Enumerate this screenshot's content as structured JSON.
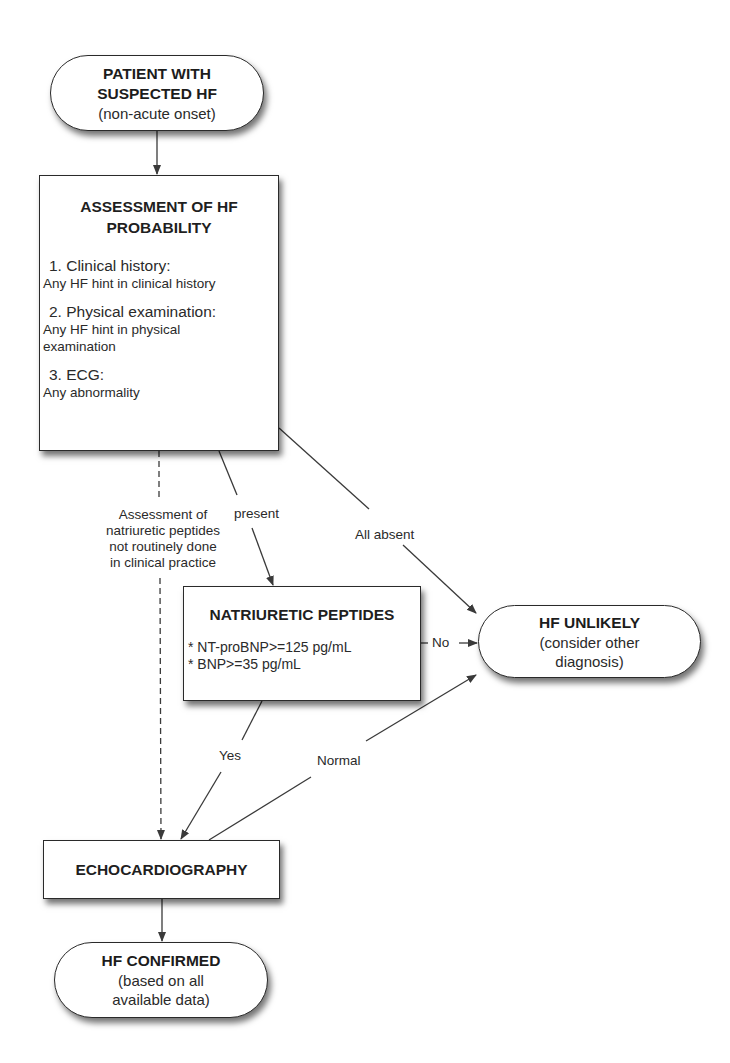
{
  "diagram": {
    "type": "flowchart",
    "nodes": {
      "start": {
        "title_line1": "PATIENT WITH",
        "title_line2": "SUSPECTED HF",
        "subtitle": "(non-acute onset)"
      },
      "assessment": {
        "title_line1": "ASSESSMENT OF HF",
        "title_line2": "PROBABILITY",
        "items": [
          {
            "heading": "1. Clinical history:",
            "body": "Any HF hint in clinical history"
          },
          {
            "heading": "2. Physical examination:",
            "body": "Any HF hint in physical examination"
          },
          {
            "heading": "3. ECG:",
            "body": "Any abnormality"
          }
        ]
      },
      "natriuretic_peptides": {
        "title": "NATRIURETIC PEPTIDES",
        "criteria": [
          "* NT-proBNP>=125 pg/mL",
          "* BNP>=35 pg/mL"
        ]
      },
      "hf_unlikely": {
        "title": "HF UNLIKELY",
        "subtitle_line1": "(consider other",
        "subtitle_line2": "diagnosis)"
      },
      "echocardiography": {
        "title": "ECHOCARDIOGRAPHY"
      },
      "hf_confirmed": {
        "title": "HF CONFIRMED",
        "subtitle_line1": "(based on all",
        "subtitle_line2": "available data)"
      }
    },
    "edge_labels": {
      "dashed_note_line1": "Assessment of",
      "dashed_note_line2": "natriuretic peptides",
      "dashed_note_line3": "not routinely done",
      "dashed_note_line4": "in clinical practice",
      "present": "present",
      "all_absent": "All absent",
      "no": "No",
      "yes": "Yes",
      "normal": "Normal"
    },
    "edges": [
      {
        "from": "start",
        "to": "assessment",
        "label": ""
      },
      {
        "from": "assessment",
        "to": "natriuretic_peptides",
        "label": "present"
      },
      {
        "from": "assessment",
        "to": "hf_unlikely",
        "label": "All absent"
      },
      {
        "from": "assessment",
        "to": "echocardiography",
        "label": "Assessment of natriuretic peptides not routinely done in clinical practice",
        "style": "dashed"
      },
      {
        "from": "natriuretic_peptides",
        "to": "hf_unlikely",
        "label": "No"
      },
      {
        "from": "natriuretic_peptides",
        "to": "echocardiography",
        "label": "Yes"
      },
      {
        "from": "echocardiography",
        "to": "hf_unlikely",
        "label": "Normal"
      },
      {
        "from": "echocardiography",
        "to": "hf_confirmed",
        "label": ""
      }
    ],
    "colors": {
      "line": "#3a3a3a",
      "border": "#2a2a2a",
      "background": "#ffffff",
      "text": "#1f1f1f"
    }
  }
}
